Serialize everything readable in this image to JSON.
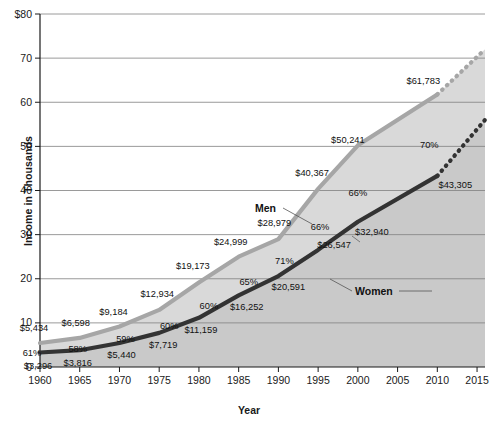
{
  "chart_data": {
    "type": "line",
    "title": "",
    "xlabel": "Year",
    "ylabel": "Income in Thousands",
    "x": [
      1960,
      1965,
      1970,
      1975,
      1980,
      1985,
      1990,
      1995,
      2000,
      2005,
      2010,
      2015
    ],
    "categories": [
      "1960",
      "1965",
      "1970",
      "1975",
      "1980",
      "1985",
      "1990",
      "1995",
      "2000",
      "2005",
      "2010",
      "2015"
    ],
    "xlim": [
      1960,
      2016
    ],
    "ylim": [
      0,
      80
    ],
    "yticks": [
      0,
      10,
      20,
      30,
      40,
      50,
      60,
      70,
      80
    ],
    "ytick_labels": [
      "0",
      "10",
      "20",
      "30",
      "40",
      "50",
      "60",
      "70",
      "$80"
    ],
    "xticks": [
      1960,
      1965,
      1970,
      1975,
      1980,
      1985,
      1990,
      1995,
      2000,
      2005,
      2010,
      2015
    ],
    "grid": "horizontal",
    "legend": "inline-annotations",
    "series": [
      {
        "name": "Men",
        "color": "#a6a6a6",
        "values": [
          5434,
          6598,
          9184,
          12934,
          19173,
          24999,
          28979,
          40367,
          50241,
          61783,
          72000
        ],
        "x": [
          1960,
          1965,
          1970,
          1975,
          1980,
          1985,
          1990,
          1995,
          2000,
          2010,
          2016
        ],
        "solid_until": 2010,
        "projected": true,
        "data_labels": [
          "$5,434",
          "$6,598",
          "$9,184",
          "$12,934",
          "$19,173",
          "$24,999",
          "$28,979",
          "$40,367",
          "$50,241",
          "$61,783"
        ]
      },
      {
        "name": "Women",
        "color": "#333333",
        "values": [
          3296,
          3816,
          5440,
          7719,
          11159,
          16252,
          20591,
          26547,
          32940,
          43305,
          56000
        ],
        "x": [
          1960,
          1965,
          1970,
          1975,
          1980,
          1985,
          1990,
          1995,
          2000,
          2010,
          2016
        ],
        "solid_until": 2010,
        "projected": true,
        "data_labels": [
          "$3,296",
          "$3,816",
          "$5,440",
          "$7,719",
          "$11,159",
          "$16,252",
          "$20,591",
          "$26,547",
          "$32,940",
          "$43,305"
        ]
      }
    ],
    "ratio_labels": {
      "description": "Women's income as percent of men's",
      "x": [
        1960,
        1965,
        1970,
        1975,
        1980,
        1985,
        1990,
        1995,
        2000,
        2010
      ],
      "values": [
        "61%",
        "58%",
        "59%",
        "60%",
        "60%",
        "65%",
        "71%",
        "66%",
        "66%",
        "70%"
      ]
    },
    "annotations": [
      {
        "name": "men-series-label",
        "text": "Men"
      },
      {
        "name": "women-series-label",
        "text": "Women"
      }
    ],
    "colors": {
      "men_line": "#a6a6a6",
      "women_line": "#333333",
      "fill_between": "#d9d9d9",
      "fill_below_women": "#c9c9c9",
      "fill_above_men": "#ffffff",
      "grid": "#808080",
      "axis": "#1a1a1a",
      "text": "#111111"
    }
  }
}
